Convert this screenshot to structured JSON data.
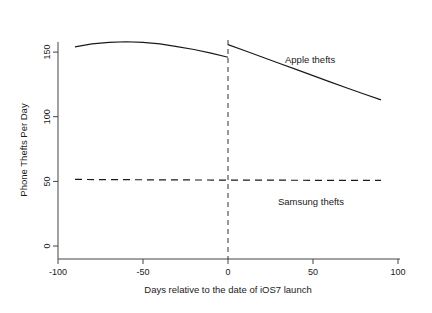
{
  "chart_data": {
    "type": "line",
    "title": "",
    "xlabel": "Days relative to the date of iOS7 launch",
    "ylabel": "Phone Thefts Per Day",
    "xlim": [
      -110,
      105
    ],
    "ylim": [
      0,
      175
    ],
    "xticks": [
      -100,
      -50,
      0,
      50,
      100
    ],
    "xticklabels": [
      "-100",
      "-50",
      "0",
      "50",
      "100"
    ],
    "yticks": [
      0,
      50,
      100,
      150
    ],
    "yticklabels": [
      "0",
      "50",
      "100",
      "150"
    ],
    "grid": false,
    "legend_position": "inline-annotations",
    "annotations": [
      {
        "name": "apple-series-label",
        "text": "Apple thefts",
        "x": 45,
        "y": 152
      },
      {
        "name": "samsung-series-label",
        "text": "Samsung thefts",
        "x": 42,
        "y": 40
      },
      {
        "name": "ios7-launch-reference",
        "text": "",
        "x": 0,
        "type": "vertical-dashed-line"
      }
    ],
    "series": [
      {
        "name": "Apple thefts",
        "style": "solid",
        "segments": [
          {
            "period": "pre-launch",
            "x": [
              -90,
              -80,
              -70,
              -60,
              -50,
              -40,
              -30,
              -20,
              -10,
              0
            ],
            "y": [
              154.0,
              156.3,
              157.6,
              158.0,
              157.6,
              156.3,
              154.2,
              152.0,
              149.2,
              146.0
            ]
          },
          {
            "period": "post-launch",
            "x": [
              0,
              10,
              20,
              30,
              40,
              50,
              60,
              70,
              80,
              90
            ],
            "y": [
              155.8,
              151.0,
              146.2,
              141.4,
              136.6,
              131.8,
              127.0,
              122.2,
              117.6,
              113.0
            ]
          }
        ]
      },
      {
        "name": "Samsung thefts",
        "style": "dashed",
        "segments": [
          {
            "period": "full",
            "x": [
              -90,
              -60,
              -30,
              0,
              30,
              60,
              90
            ],
            "y": [
              51.5,
              51.3,
              51.1,
              51.0,
              50.9,
              50.8,
              50.7
            ]
          }
        ]
      }
    ]
  },
  "axes": {
    "y_axis_title": "Phone Thefts Per Day",
    "x_axis_title": "Days relative to the date of iOS7 launch"
  }
}
